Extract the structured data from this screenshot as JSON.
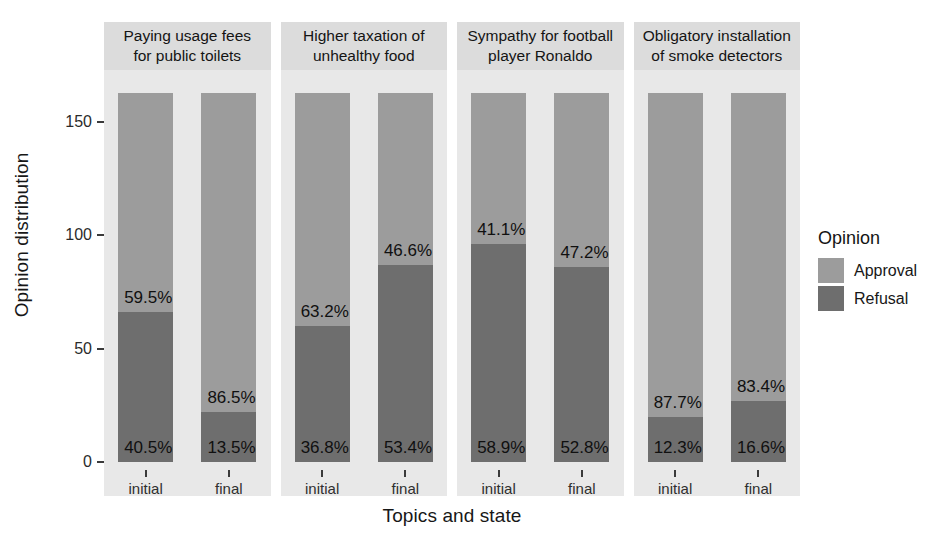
{
  "chart_data": {
    "type": "bar",
    "subtype": "stacked-percent-faceted",
    "title": "",
    "xlabel": "Topics and state",
    "ylabel": "Opinion distribution",
    "ylim": [
      0,
      165
    ],
    "yticks": [
      0,
      50,
      100,
      150
    ],
    "ytick_labels": [
      "0",
      "50",
      "100",
      "150"
    ],
    "grid": false,
    "legend": {
      "title": "Opinion",
      "position": "right",
      "entries": [
        {
          "name": "Approval",
          "color": "#9c9c9c"
        },
        {
          "name": "Refusal",
          "color": "#6e6e6e"
        }
      ]
    },
    "facet_labels": [
      "Paying usage fees\nfor public toilets",
      "Higher taxation of\nunhealthy food",
      "Sympathy for football\nplayer Ronaldo",
      "Obligatory installation\nof smoke detectors"
    ],
    "categories": [
      "initial",
      "final"
    ],
    "series": [
      {
        "name": "Approval",
        "color": "#9c9c9c"
      },
      {
        "name": "Refusal",
        "color": "#6e6e6e"
      }
    ],
    "panels": [
      {
        "facet": "Paying usage fees for public toilets",
        "bars": [
          {
            "category": "initial",
            "total": 163,
            "segments": [
              {
                "series": "Refusal",
                "percent": 40.5,
                "label": "40.5%"
              },
              {
                "series": "Approval",
                "percent": 59.5,
                "label": "59.5%"
              }
            ]
          },
          {
            "category": "final",
            "total": 163,
            "segments": [
              {
                "series": "Refusal",
                "percent": 13.5,
                "label": "13.5%"
              },
              {
                "series": "Approval",
                "percent": 86.5,
                "label": "86.5%"
              }
            ]
          }
        ]
      },
      {
        "facet": "Higher taxation of unhealthy food",
        "bars": [
          {
            "category": "initial",
            "total": 163,
            "segments": [
              {
                "series": "Refusal",
                "percent": 36.8,
                "label": "36.8%"
              },
              {
                "series": "Approval",
                "percent": 63.2,
                "label": "63.2%"
              }
            ]
          },
          {
            "category": "final",
            "total": 163,
            "segments": [
              {
                "series": "Refusal",
                "percent": 53.4,
                "label": "53.4%"
              },
              {
                "series": "Approval",
                "percent": 46.6,
                "label": "46.6%"
              }
            ]
          }
        ]
      },
      {
        "facet": "Sympathy for football player Ronaldo",
        "bars": [
          {
            "category": "initial",
            "total": 163,
            "segments": [
              {
                "series": "Refusal",
                "percent": 58.9,
                "label": "58.9%"
              },
              {
                "series": "Approval",
                "percent": 41.1,
                "label": "41.1%"
              }
            ]
          },
          {
            "category": "final",
            "total": 163,
            "segments": [
              {
                "series": "Refusal",
                "percent": 52.8,
                "label": "52.8%"
              },
              {
                "series": "Approval",
                "percent": 47.2,
                "label": "47.2%"
              }
            ]
          }
        ]
      },
      {
        "facet": "Obligatory installation of smoke detectors",
        "bars": [
          {
            "category": "initial",
            "total": 163,
            "segments": [
              {
                "series": "Refusal",
                "percent": 12.3,
                "label": "12.3%"
              },
              {
                "series": "Approval",
                "percent": 87.7,
                "label": "87.7%"
              }
            ]
          },
          {
            "category": "final",
            "total": 163,
            "segments": [
              {
                "series": "Refusal",
                "percent": 16.6,
                "label": "16.6%"
              },
              {
                "series": "Approval",
                "percent": 83.4,
                "label": "83.4%"
              }
            ]
          }
        ]
      }
    ]
  },
  "axes": {
    "y_title": "Opinion distribution",
    "x_title": "Topics and state",
    "y_ticks": [
      {
        "value": 150,
        "label": "150"
      },
      {
        "value": 100,
        "label": "100"
      },
      {
        "value": 50,
        "label": "50"
      },
      {
        "value": 0,
        "label": "0"
      }
    ]
  },
  "facets": [
    {
      "line1": "Paying usage fees",
      "line2": "for public toilets"
    },
    {
      "line1": "Higher taxation of",
      "line2": "unhealthy food"
    },
    {
      "line1": "Sympathy for football",
      "line2": "player Ronaldo"
    },
    {
      "line1": "Obligatory installation",
      "line2": "of smoke detectors"
    }
  ],
  "x_labels": [
    "initial",
    "final"
  ],
  "legend": {
    "title": "Opinion",
    "items": [
      {
        "label": "Approval"
      },
      {
        "label": "Refusal"
      }
    ]
  },
  "colors": {
    "approval": "#9c9c9c",
    "refusal": "#6e6e6e",
    "panel_bg": "#e8e8e8",
    "strip_bg": "#dcdcdc",
    "text": "#141414"
  }
}
